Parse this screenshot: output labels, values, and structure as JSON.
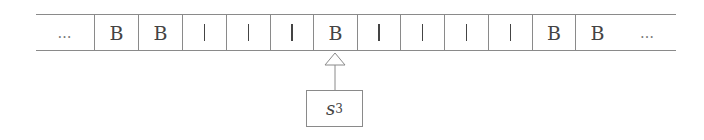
{
  "diagram": {
    "type": "turing-machine-tape",
    "tape": {
      "cells": [
        {
          "symbol": "…",
          "kind": "ellipsis",
          "left": 36,
          "width": 58
        },
        {
          "symbol": "B",
          "kind": "blank",
          "left": 94,
          "width": 44
        },
        {
          "symbol": "B",
          "kind": "blank",
          "left": 138,
          "width": 44
        },
        {
          "symbol": "|",
          "kind": "stroke",
          "left": 182,
          "width": 44
        },
        {
          "symbol": "|",
          "kind": "stroke",
          "left": 226,
          "width": 44
        },
        {
          "symbol": "|",
          "kind": "stroke",
          "left": 270,
          "width": 43
        },
        {
          "symbol": "B",
          "kind": "blank",
          "left": 313,
          "width": 44,
          "head": true
        },
        {
          "symbol": "|",
          "kind": "stroke",
          "left": 357,
          "width": 43
        },
        {
          "symbol": "|",
          "kind": "stroke",
          "left": 400,
          "width": 44
        },
        {
          "symbol": "|",
          "kind": "stroke",
          "left": 444,
          "width": 44
        },
        {
          "symbol": "|",
          "kind": "stroke",
          "left": 488,
          "width": 44
        },
        {
          "symbol": "B",
          "kind": "blank",
          "left": 532,
          "width": 43
        },
        {
          "symbol": "B",
          "kind": "blank",
          "left": 575,
          "width": 44
        },
        {
          "symbol": "…",
          "kind": "ellipsis",
          "left": 619,
          "width": 57
        }
      ]
    },
    "head": {
      "icon": "arrow-up-icon",
      "position_index": 6
    },
    "state": {
      "label": "s",
      "subscript": "3"
    },
    "colors": {
      "line": "#8a8a8a",
      "text": "#444444",
      "background": "#ffffff"
    }
  }
}
